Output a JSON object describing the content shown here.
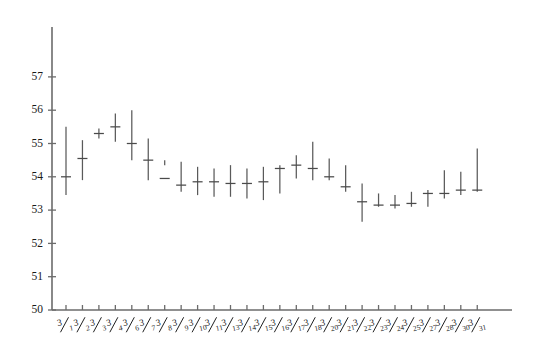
{
  "chart_data": {
    "type": "bar",
    "subtype": "ohlc-range-bar",
    "title": "",
    "subtitle": "",
    "xlabel": "",
    "ylabel": "",
    "ylim": [
      50,
      57.6
    ],
    "yticks": [
      50,
      51,
      52,
      53,
      54,
      55,
      56,
      57
    ],
    "ytick_labels": [
      "50",
      "51",
      "52",
      "53",
      "54",
      "55",
      "56",
      "57"
    ],
    "grid": false,
    "legend": null,
    "axis_color": "#6b6b6b",
    "bar_color": "#5a5a5a",
    "background": "#ffffff",
    "categories": [
      "3/1",
      "3/2",
      "3/3",
      "3/4",
      "3/6",
      "3/7",
      "3/8",
      "3/9",
      "3/10",
      "3/11",
      "3/13",
      "3/14",
      "3/15",
      "3/16",
      "3/17",
      "3/18",
      "3/20",
      "3/21",
      "3/22",
      "3/23",
      "3/24",
      "3/25",
      "3/27",
      "3/28",
      "3/30",
      "3/31"
    ],
    "category_numerator": "3",
    "category_denominators": [
      "1",
      "2",
      "3",
      "4",
      "6",
      "7",
      "8",
      "9",
      "10",
      "11",
      "13",
      "14",
      "15",
      "16",
      "17",
      "18",
      "20",
      "21",
      "22",
      "23",
      "24",
      "25",
      "27",
      "28",
      "30",
      "31"
    ],
    "series": [
      {
        "name": "High",
        "values": [
          55.5,
          55.1,
          55.45,
          55.9,
          56.0,
          55.15,
          54.5,
          54.45,
          54.3,
          54.25,
          54.35,
          54.25,
          54.3,
          54.35,
          54.65,
          55.05,
          54.55,
          54.35,
          53.8,
          53.5,
          53.45,
          53.55,
          53.6,
          54.2,
          54.15,
          54.85
        ]
      },
      {
        "name": "Low",
        "values": [
          53.45,
          53.9,
          55.15,
          55.05,
          54.5,
          53.9,
          54.35,
          53.55,
          53.45,
          53.4,
          53.4,
          53.35,
          53.3,
          53.5,
          53.95,
          53.9,
          53.9,
          53.55,
          52.65,
          53.1,
          53.05,
          53.1,
          53.1,
          53.35,
          53.45,
          53.55
        ]
      },
      {
        "name": "Close",
        "values": [
          54.0,
          54.55,
          55.3,
          55.5,
          55.0,
          54.5,
          53.95,
          53.75,
          53.85,
          53.85,
          53.8,
          53.8,
          53.85,
          54.25,
          54.35,
          54.25,
          54.0,
          53.7,
          53.25,
          53.15,
          53.15,
          53.2,
          53.5,
          53.5,
          53.6,
          53.6
        ]
      }
    ]
  }
}
